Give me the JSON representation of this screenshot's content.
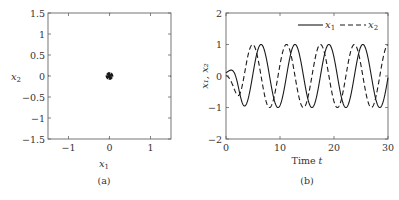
{
  "chart_data": [
    {
      "type": "line",
      "panel": "(a)",
      "title": "",
      "xlabel": "x_1",
      "ylabel": "x_2",
      "xlim": [
        -1.5,
        1.5
      ],
      "ylim": [
        -1.5,
        1.5
      ],
      "xticks": [
        "-1",
        "0",
        "1"
      ],
      "yticks": [
        "1.5",
        "1",
        "0.5",
        "0",
        "-0.5",
        "-1",
        "-1.5"
      ],
      "grid": false,
      "description": "Phase portrait: trajectories spiral toward a stable limit cycle of radius 1 from inside (starting near origin) and outside (starting at box edges), with direction arrows; counter-clockwise rotation.",
      "limit_cycle_radius": 1,
      "series": [
        {
          "name": "outer trajectories",
          "start_points": [
            [
              -1.5,
              1.5
            ],
            [
              0,
              1.5
            ],
            [
              1.5,
              1.5
            ],
            [
              1.5,
              0
            ],
            [
              1.5,
              -1.5
            ],
            [
              0,
              -1.5
            ],
            [
              -1.5,
              -1.5
            ],
            [
              -1.5,
              0
            ]
          ]
        },
        {
          "name": "inner trajectories",
          "start_points": [
            [
              0.05,
              0
            ],
            [
              -0.05,
              0
            ],
            [
              0,
              0.05
            ],
            [
              0,
              -0.05
            ]
          ]
        }
      ]
    },
    {
      "type": "line",
      "panel": "(b)",
      "title": "",
      "xlabel": "Time t",
      "ylabel": "x_1, x_2",
      "xlim": [
        0,
        30
      ],
      "ylim": [
        -2,
        2
      ],
      "xticks": [
        "0",
        "10",
        "20",
        "30"
      ],
      "yticks": [
        "2",
        "1",
        "0",
        "-1",
        "-2"
      ],
      "grid": false,
      "legend": {
        "position": "upper right",
        "entries": [
          "x_1",
          "x_2"
        ]
      },
      "series": [
        {
          "name": "x_1",
          "style": "solid",
          "description": "starts ~0.1, dips to -1 near t≈3.2, then oscillates between -1 and 1 with period ≈6.28; peaks at t≈6.3, 12.6, 18.9, 25.1"
        },
        {
          "name": "x_2",
          "style": "dashed",
          "description": "starts ~0, leads x_1 by ~quarter period; peaks at t≈4.7, 11.0, 17.3, 23.6, 29.8; troughs ≈ -1"
        }
      ]
    }
  ],
  "panels": {
    "a": {
      "caption": "(a)",
      "xlabel_main": "x",
      "xlabel_sub": "1",
      "ylabel_main": "x",
      "ylabel_sub": "2",
      "yticks": [
        "1.5",
        "1",
        "0.5",
        "0",
        "−0.5",
        "−1",
        "−1.5"
      ],
      "xticks": [
        "−1",
        "0",
        "1"
      ]
    },
    "b": {
      "caption": "(b)",
      "xlabel": "Time ",
      "xlabel_var": "t",
      "ylabel": "x₁, x₂",
      "yticks": [
        "2",
        "1",
        "0",
        "−1",
        "−2"
      ],
      "xticks": [
        "0",
        "10",
        "20",
        "30"
      ],
      "legend_x1_main": "x",
      "legend_x1_sub": "1",
      "legend_x2_main": "x",
      "legend_x2_sub": "2"
    }
  },
  "colors": {
    "line": "#1a1a1a",
    "axis": "#555555"
  }
}
